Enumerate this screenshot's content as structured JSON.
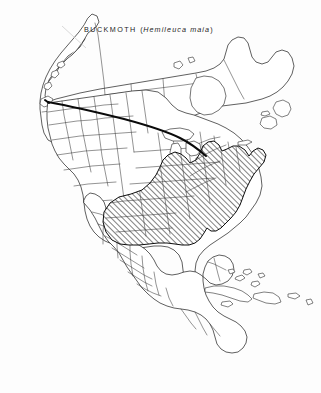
{
  "figure": {
    "kind": "range-map",
    "region": "North America",
    "title": {
      "common_name": "BUCKMOTH",
      "open_paren": "(",
      "scientific_name": "Hemileuca maia",
      "close_paren": ")"
    },
    "colors": {
      "background": "#ffffff",
      "coastline": "#1b1b1b",
      "internal_boundary": "#3a3a3a",
      "bold_border": "#0a0a0a",
      "range_hatch": "#0d0d0d"
    },
    "legend_implicit": {
      "hatched_area_meaning": "species distribution / range",
      "hatch_style": "single diagonal lines, lower-left to upper-right",
      "bold_line_meaning": "Canada - United States border (49th parallel)"
    },
    "range_description": "Eastern United States from eastern Texas and the Great Plains east to the Atlantic coast, north to the Great Lakes, southern Ontario and New England, south to northern Florida and the Gulf Coast",
    "unhatched_areas": [
      "Alaska",
      "Canada north of the Great Lakes",
      "western United States",
      "Mexico",
      "Central America",
      "Cuba",
      "Hispaniola",
      "Puerto Rico",
      "Bahamas",
      "peninsular Florida"
    ]
  }
}
